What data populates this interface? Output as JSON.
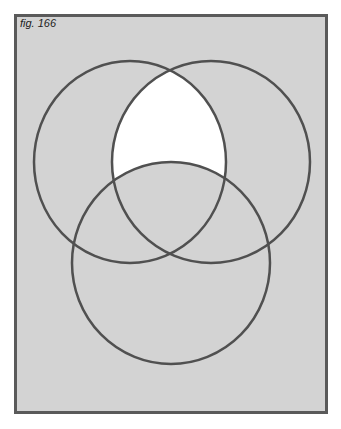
{
  "figure": {
    "label": "fig. 166",
    "background_color": "#d3d3d3",
    "frame_color": "#5a5a5a",
    "line_color": "#505050",
    "highlight_color": "#ffffff"
  },
  "venn": {
    "sets": [
      {
        "name": "top-left",
        "cx": 130,
        "cy": 162,
        "rx": 96,
        "ry": 101
      },
      {
        "name": "top-right",
        "cx": 211,
        "cy": 162,
        "rx": 99,
        "ry": 101
      },
      {
        "name": "bottom",
        "cx": 171,
        "cy": 263,
        "rx": 99,
        "ry": 101
      }
    ],
    "shaded_region": "intersection of top-left and top-right minus bottom (white)"
  }
}
